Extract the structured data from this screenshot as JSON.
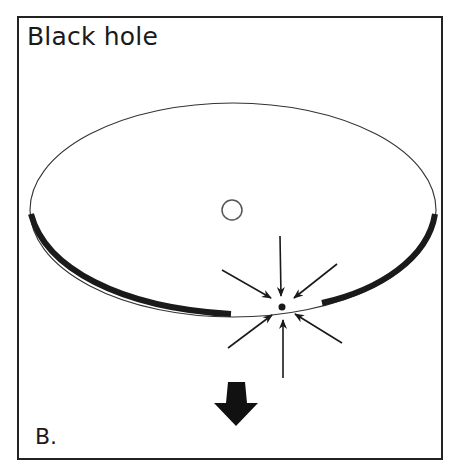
{
  "figure": {
    "title": "Black hole",
    "panel_label": "B."
  },
  "elements": {
    "disk": "accretion-disk",
    "center_object": "small-circle",
    "collapse_point": "point-with-converging-arrows",
    "converging_arrow_count": 6,
    "motion_arrow": "large-down-arrow"
  },
  "colors": {
    "ink": "#1a1a1a",
    "background": "#ffffff"
  }
}
